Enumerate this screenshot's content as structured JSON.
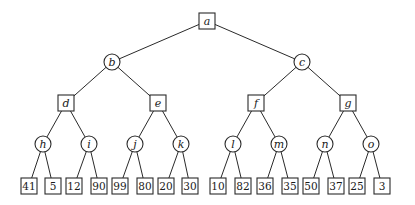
{
  "diagram": {
    "type": "game-tree",
    "levels": [
      {
        "shape": "square",
        "nodes": [
          "a"
        ]
      },
      {
        "shape": "circle",
        "nodes": [
          "b",
          "c"
        ]
      },
      {
        "shape": "square",
        "nodes": [
          "d",
          "e",
          "f",
          "g"
        ]
      },
      {
        "shape": "circle",
        "nodes": [
          "h",
          "i",
          "j",
          "k",
          "l",
          "m",
          "n",
          "o"
        ]
      },
      {
        "shape": "square",
        "nodes": [
          "41",
          "5",
          "12",
          "90",
          "99",
          "80",
          "20",
          "30",
          "10",
          "82",
          "36",
          "35",
          "50",
          "37",
          "25",
          "3"
        ]
      }
    ],
    "edges": [
      [
        "a",
        "b"
      ],
      [
        "a",
        "c"
      ],
      [
        "b",
        "d"
      ],
      [
        "b",
        "e"
      ],
      [
        "c",
        "f"
      ],
      [
        "c",
        "g"
      ],
      [
        "d",
        "h"
      ],
      [
        "d",
        "i"
      ],
      [
        "e",
        "j"
      ],
      [
        "e",
        "k"
      ],
      [
        "f",
        "l"
      ],
      [
        "f",
        "m"
      ],
      [
        "g",
        "n"
      ],
      [
        "g",
        "o"
      ],
      [
        "h",
        "41"
      ],
      [
        "h",
        "5"
      ],
      [
        "i",
        "12"
      ],
      [
        "i",
        "90"
      ],
      [
        "j",
        "99"
      ],
      [
        "j",
        "80"
      ],
      [
        "k",
        "20"
      ],
      [
        "k",
        "30"
      ],
      [
        "l",
        "10"
      ],
      [
        "l",
        "82"
      ],
      [
        "m",
        "36"
      ],
      [
        "m",
        "35"
      ],
      [
        "n",
        "50"
      ],
      [
        "n",
        "37"
      ],
      [
        "o",
        "25"
      ],
      [
        "o",
        "3"
      ]
    ],
    "leaf_values": [
      41,
      5,
      12,
      90,
      99,
      80,
      20,
      30,
      10,
      82,
      36,
      35,
      50,
      37,
      25,
      3
    ]
  }
}
